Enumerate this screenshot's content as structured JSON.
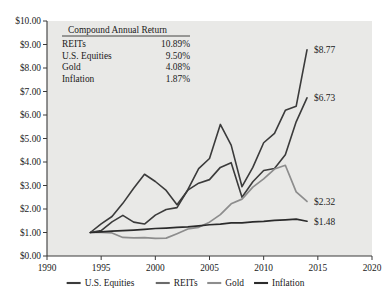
{
  "chart_data": {
    "type": "line",
    "title": "",
    "xlabel": "",
    "ylabel": "",
    "xlim": [
      1990,
      2020
    ],
    "ylim": [
      0,
      10
    ],
    "grid": false,
    "legend_position": "bottom",
    "xticks": [
      "1990",
      "1995",
      "2000",
      "2005",
      "2010",
      "2015",
      "2020"
    ],
    "yticks": [
      "$0.00",
      "$1.00",
      "$2.00",
      "$3.00",
      "$4.00",
      "$5.00",
      "$6.00",
      "$7.00",
      "$8.00",
      "$9.00",
      "$10.00"
    ],
    "x": [
      1994,
      1995,
      1996,
      1997,
      1998,
      1999,
      2000,
      2001,
      2002,
      2003,
      2004,
      2005,
      2006,
      2007,
      2008,
      2009,
      2010,
      2011,
      2012,
      2013,
      2014
    ],
    "series": [
      {
        "name": "REITs",
        "color": "#3b3b3b",
        "values": [
          1.0,
          1.08,
          1.45,
          1.73,
          1.44,
          1.36,
          1.74,
          1.98,
          2.06,
          2.82,
          3.72,
          4.15,
          5.6,
          4.72,
          2.95,
          3.77,
          4.82,
          5.22,
          6.2,
          6.37,
          8.77
        ],
        "end_label": "$8.77",
        "compound_annual_return": "10.89%"
      },
      {
        "name": "U.S. Equities",
        "color": "#3b3b3b",
        "values": [
          1.0,
          1.37,
          1.68,
          2.24,
          2.88,
          3.48,
          3.17,
          2.79,
          2.18,
          2.8,
          3.1,
          3.25,
          3.77,
          3.97,
          2.5,
          3.16,
          3.64,
          3.72,
          4.31,
          5.71,
          6.73
        ],
        "end_label": "$6.73",
        "compound_annual_return": "9.50%"
      },
      {
        "name": "Gold",
        "color": "#8d8d8d",
        "values": [
          1.0,
          1.0,
          0.98,
          0.79,
          0.77,
          0.78,
          0.75,
          0.76,
          0.95,
          1.15,
          1.22,
          1.44,
          1.76,
          2.22,
          2.42,
          2.93,
          3.28,
          3.7,
          3.86,
          2.73,
          2.32
        ],
        "end_label": "$2.32",
        "compound_annual_return": "4.08%"
      },
      {
        "name": "Inflation",
        "color": "#2b2b2b",
        "values": [
          1.0,
          1.03,
          1.06,
          1.08,
          1.1,
          1.13,
          1.17,
          1.19,
          1.22,
          1.24,
          1.28,
          1.33,
          1.36,
          1.41,
          1.41,
          1.45,
          1.47,
          1.52,
          1.54,
          1.57,
          1.48
        ],
        "end_label": "$1.48",
        "compound_annual_return": "1.87%"
      }
    ]
  },
  "legend_table": {
    "title": "Compound Annual Return",
    "rows": [
      {
        "label": "REITs",
        "value": "10.89%"
      },
      {
        "label": "U.S. Equities",
        "value": "9.50%"
      },
      {
        "label": "Gold",
        "value": "4.08%"
      },
      {
        "label": "Inflation",
        "value": "1.87%"
      }
    ]
  },
  "bottom_legend": {
    "items": [
      {
        "label": "U.S. Equities",
        "color": "#3b3b3b"
      },
      {
        "label": "REITs",
        "color": "#6a6a6a"
      },
      {
        "label": "Gold",
        "color": "#8d8d8d"
      },
      {
        "label": "Inflation",
        "color": "#2b2b2b"
      }
    ]
  },
  "colors": {
    "plot_background": "#e9e9e7",
    "page_background": "#ffffff",
    "axis": "#3a3a3a",
    "text": "#1a1a1a"
  }
}
